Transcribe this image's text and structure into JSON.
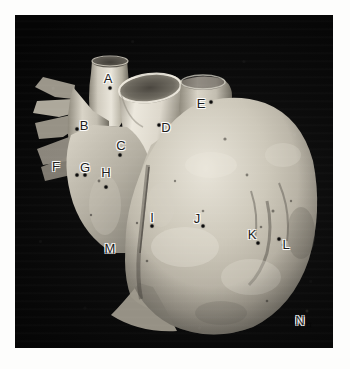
{
  "figure": {
    "kind": "anatomical-photograph",
    "plate_background_color": "#0a0a0a",
    "page_background_color": "#ffffff",
    "label_text_color": "#1d1d1d",
    "label_halo_color": "#ffffff",
    "specimen_color": "#c9c4b8",
    "plate": {
      "x": 15,
      "y": 15,
      "width": 318,
      "height": 333
    }
  },
  "labels": [
    {
      "id": "A",
      "text": "A",
      "x": 93,
      "y": 63,
      "dot_x": 95,
      "dot_y": 73
    },
    {
      "id": "B",
      "text": "B",
      "x": 69,
      "y": 110,
      "dot_x": 62,
      "dot_y": 114
    },
    {
      "id": "C",
      "text": "C",
      "x": 106,
      "y": 130,
      "dot_x": 105,
      "dot_y": 140
    },
    {
      "id": "D",
      "text": "D",
      "x": 151,
      "y": 112,
      "dot_x": 144,
      "dot_y": 110
    },
    {
      "id": "E",
      "text": "E",
      "x": 186,
      "y": 88,
      "dot_x": 196,
      "dot_y": 87
    },
    {
      "id": "F",
      "text": "F",
      "x": 41,
      "y": 151,
      "dot_x": 62,
      "dot_y": 160
    },
    {
      "id": "G",
      "text": "G",
      "x": 70,
      "y": 152,
      "dot_x": 70,
      "dot_y": 160
    },
    {
      "id": "H",
      "text": "H",
      "x": 91,
      "y": 157,
      "dot_x": 91,
      "dot_y": 172
    },
    {
      "id": "I",
      "text": "I",
      "x": 137,
      "y": 202,
      "dot_x": 137,
      "dot_y": 211
    },
    {
      "id": "J",
      "text": "J",
      "x": 182,
      "y": 203,
      "dot_x": 188,
      "dot_y": 211
    },
    {
      "id": "K",
      "text": "K",
      "x": 237,
      "y": 219,
      "dot_x": 243,
      "dot_y": 228
    },
    {
      "id": "L",
      "text": "L",
      "x": 271,
      "y": 229,
      "dot_x": 264,
      "dot_y": 224
    },
    {
      "id": "M",
      "text": "M",
      "x": 95,
      "y": 233,
      "dot_x": null,
      "dot_y": null
    },
    {
      "id": "N",
      "text": "N",
      "x": 285,
      "y": 305,
      "dot_x": 294,
      "dot_y": 310
    }
  ]
}
